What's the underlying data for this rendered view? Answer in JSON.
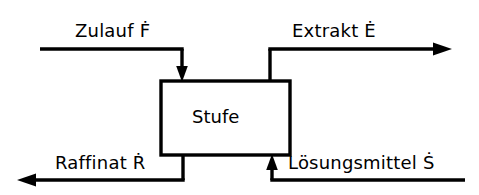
{
  "diagram": {
    "type": "process-flow-block-diagram",
    "language": "de",
    "background_color": "#ffffff",
    "line_color": "#000000",
    "unit": {
      "label": "Stufe",
      "box": {
        "x": 161,
        "y": 81,
        "width": 129,
        "height": 74
      }
    },
    "streams": [
      {
        "id": "feed",
        "label": "Zulauf",
        "symbol": "F",
        "symbol_accent": "dot",
        "symbol_display": "Ḟ",
        "label_full": "Zulauf Ḟ",
        "direction": "in",
        "enters": "top-left",
        "arrowhead": "down"
      },
      {
        "id": "extract",
        "label": "Extrakt",
        "symbol": "E",
        "symbol_accent": "dot",
        "symbol_display": "Ė",
        "label_full": "Extrakt Ė",
        "direction": "out",
        "exits": "top-right",
        "arrowhead": "right"
      },
      {
        "id": "raffinate",
        "label": "Raffinat",
        "symbol": "R",
        "symbol_accent": "dot",
        "symbol_display": "Ṙ",
        "label_full": "Raffinat Ṙ",
        "direction": "out",
        "exits": "bottom-left",
        "arrowhead": "left"
      },
      {
        "id": "solvent",
        "label": "Lösungsmittel",
        "symbol": "S",
        "symbol_accent": "dot",
        "symbol_display": "Ṡ",
        "label_full": "Lösungsmittel Ṡ",
        "direction": "in",
        "enters": "bottom-right",
        "arrowhead": "up"
      }
    ]
  }
}
